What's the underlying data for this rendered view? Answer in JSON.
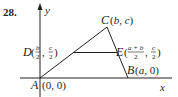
{
  "problem_number": "28.",
  "axes": {
    "x_label": "x",
    "y_label": "y"
  },
  "points": {
    "A": {
      "name": "A",
      "coords": "(0, 0)"
    },
    "B": {
      "name": "B",
      "coords": "(a, 0)"
    },
    "C": {
      "name": "C",
      "coords": "(b, c)"
    },
    "D": {
      "name": "D",
      "x_num": "b",
      "x_den": "2",
      "y_num": "c",
      "y_den": "2"
    },
    "E": {
      "name": "E",
      "x_num": "a + b",
      "x_den": "2",
      "y_num": "c",
      "y_den": "2"
    }
  },
  "colors": {
    "line": "#231f20",
    "background": "#ffffff"
  }
}
